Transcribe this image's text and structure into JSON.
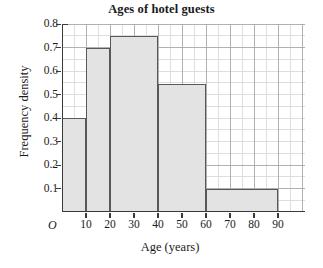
{
  "chart_data": {
    "type": "bar",
    "title": "Ages of hotel guests",
    "xlabel": "Age (years)",
    "ylabel": "Frequency density",
    "origin_label": "O",
    "xlim": [
      0,
      90
    ],
    "ylim": [
      0,
      0.8
    ],
    "grid": true,
    "grid_major_x_step": 10,
    "grid_minor_x_step": 5,
    "grid_major_y_step": 0.1,
    "grid_minor_y_step": 0.05,
    "legend": null,
    "xticks": [
      "10",
      "20",
      "30",
      "40",
      "50",
      "60",
      "70",
      "80",
      "90"
    ],
    "xtick_values": [
      10,
      20,
      30,
      40,
      50,
      60,
      70,
      80,
      90
    ],
    "yticks": [
      "0.1",
      "0.2",
      "0.3",
      "0.4",
      "0.5",
      "0.6",
      "0.7",
      "0.8"
    ],
    "ytick_values": [
      0.1,
      0.2,
      0.3,
      0.4,
      0.5,
      0.6,
      0.7,
      0.8
    ],
    "bars": [
      {
        "label": "0-10",
        "x_start": 0,
        "x_end": 10,
        "value": 0.4
      },
      {
        "label": "10-20",
        "x_start": 10,
        "x_end": 20,
        "value": 0.7
      },
      {
        "label": "20-40",
        "x_start": 20,
        "x_end": 40,
        "value": 0.75
      },
      {
        "label": "40-60",
        "x_start": 40,
        "x_end": 60,
        "value": 0.545
      },
      {
        "label": "60-90",
        "x_start": 60,
        "x_end": 90,
        "value": 0.1
      }
    ],
    "bar_fill_color": "#e3e3e3",
    "bar_edge_color": "#585858",
    "grid_color": "#b8b8b8",
    "axis_color": "#3a3a3a"
  }
}
